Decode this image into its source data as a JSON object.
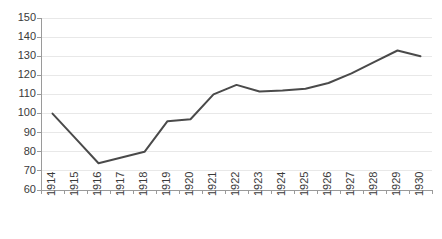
{
  "chart_data": {
    "type": "line",
    "title": "",
    "subtitle": "",
    "xlabel": "",
    "ylabel": "",
    "categories": [
      "1914",
      "1915",
      "1916",
      "1917",
      "1918",
      "1919",
      "1920",
      "1921",
      "1922",
      "1923",
      "1924",
      "1925",
      "1926",
      "1927",
      "1928",
      "1929",
      "1930"
    ],
    "values": [
      100,
      87,
      74,
      77,
      80,
      96,
      97,
      110,
      115,
      111.5,
      112,
      113,
      116,
      121,
      127,
      133,
      130
    ],
    "series": [
      {
        "name": "",
        "values": [
          100,
          87,
          74,
          77,
          80,
          96,
          97,
          110,
          115,
          111.5,
          112,
          113,
          116,
          121,
          127,
          133,
          130
        ]
      }
    ],
    "ylim": [
      60,
      150
    ],
    "ytick_values": [
      60,
      70,
      80,
      90,
      100,
      110,
      120,
      130,
      140,
      150
    ],
    "ytick_labels": [
      "60",
      "70",
      "80",
      "90",
      "100",
      "110",
      "120",
      "130",
      "140",
      "150"
    ],
    "xtick_labels": [
      "1914",
      "1915",
      "1916",
      "1917",
      "1918",
      "1919",
      "1920",
      "1921",
      "1922",
      "1923",
      "1924",
      "1925",
      "1926",
      "1927",
      "1928",
      "1929",
      "1930"
    ],
    "xtick_rotation": -90,
    "grid": true,
    "grid_axis": "y",
    "legend": false,
    "legend_position": "none",
    "annotations": [],
    "line_color": "#4a4a4a",
    "grid_color": "#e8e8e8",
    "axis_color": "#9a9a9a",
    "background_color": "#ffffff"
  },
  "layout": {
    "plot_left": 41,
    "plot_right": 432,
    "plot_top": 18,
    "plot_bottom": 190,
    "ytick_label_x": 36,
    "xtick_label_y": 196,
    "tick_length": 4
  }
}
